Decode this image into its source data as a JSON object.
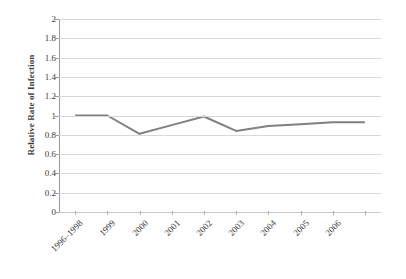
{
  "chart_data": {
    "type": "line",
    "title": "",
    "xlabel": "",
    "ylabel": "Relative Rate of Infection",
    "categories": [
      "1996–1998",
      "1999",
      "2000",
      "2001",
      "2002",
      "2003",
      "2004",
      "2005",
      "2006"
    ],
    "values": [
      1.0,
      1.0,
      0.81,
      0.9,
      0.99,
      0.84,
      0.89,
      0.91,
      0.93
    ],
    "series": [
      {
        "name": "Relative Rate of Infection",
        "values": [
          1.0,
          1.0,
          0.81,
          0.9,
          0.99,
          0.84,
          0.89,
          0.91,
          0.93
        ],
        "color": "#808080"
      }
    ],
    "ylim": [
      0,
      2
    ],
    "ytick_values": [
      2,
      1.8,
      1.6,
      1.4,
      1.2,
      1,
      0.8,
      0.6,
      0.4,
      0.2,
      0
    ],
    "ytick_labels": [
      "2",
      "1.8",
      "1.6",
      "1.4",
      "1.2",
      "1",
      "0.8",
      "0.6",
      "0.4",
      "0.2",
      "0"
    ],
    "grid": true,
    "grid_color": "#d8d8d8",
    "legend": false,
    "legend_position": "none",
    "markers": false,
    "line_width": 2,
    "background_color": "#ffffff",
    "xtick_rotation": -45,
    "x_axis_extra_tick": true,
    "trailing_segment_value": 0.93
  }
}
